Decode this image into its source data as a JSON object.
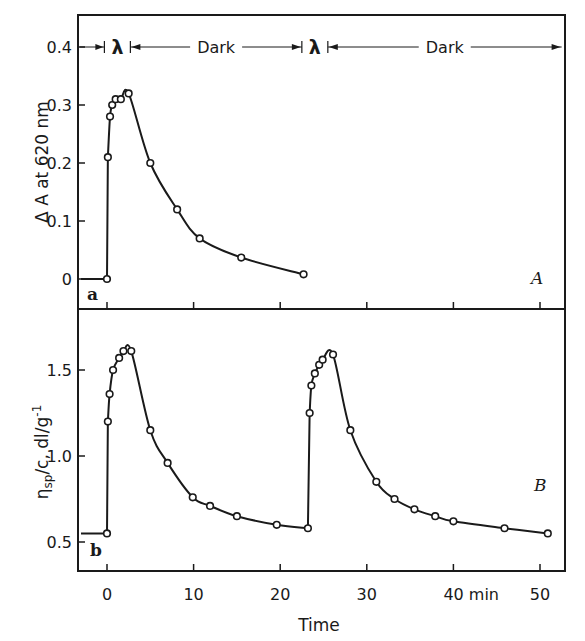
{
  "figure": {
    "x_axis": {
      "label": "Time",
      "unit_label": "min",
      "ticks": [
        0,
        10,
        20,
        30,
        40,
        50
      ],
      "tick_labels": [
        "0",
        "10",
        "20",
        "30",
        "40 min",
        "50"
      ]
    },
    "panel_a": {
      "corner_label": "a",
      "panel_label": "A",
      "ylabel": "Δ A at 620 nm",
      "y_ticks": [
        "0",
        "0.1",
        "0.2",
        "0.3",
        "0.4"
      ],
      "periods": [
        {
          "label": "λ",
          "start": -0.3,
          "end": 2.7
        },
        {
          "label": "Dark",
          "start": 2.7,
          "end": 22.5
        },
        {
          "label": "λ",
          "start": 22.5,
          "end": 25.5
        },
        {
          "label": "Dark",
          "start": 25.5,
          "end": 52.5
        }
      ]
    },
    "panel_b": {
      "corner_label": "b",
      "panel_label": "B",
      "ylabel_main": "η",
      "ylabel_sub": "sp",
      "ylabel_rest": "/c, dl/g",
      "ylabel_sup": "-1",
      "y_ticks": [
        "0.5",
        "1.0",
        "1.5"
      ]
    },
    "colors": {
      "ink": "#1a1a1a",
      "background": "#ffffff"
    }
  },
  "chart_data": [
    {
      "type": "line",
      "title": "",
      "panel": "A",
      "xlabel": "Time (min)",
      "ylabel": "Δ A at 620 nm",
      "xlim": [
        -3,
        53
      ],
      "ylim": [
        -0.05,
        0.44
      ],
      "y_ticks": [
        0,
        0.1,
        0.2,
        0.3,
        0.4
      ],
      "x_ticks": [
        0,
        10,
        20,
        30,
        40,
        50
      ],
      "grid": false,
      "markers": "open circles",
      "annotations": [
        "λ (0–2.5 min)",
        "Dark",
        "λ",
        "Dark",
        "a",
        "A"
      ],
      "series": [
        {
          "name": "ΔA620",
          "x": [
            -3.0,
            0.0,
            0.1,
            0.35,
            0.6,
            1.0,
            1.6,
            2.5,
            5.0,
            8.1,
            10.7,
            15.5,
            22.7
          ],
          "y": [
            0.0,
            0.0,
            0.21,
            0.28,
            0.3,
            0.31,
            0.31,
            0.32,
            0.2,
            0.12,
            0.07,
            0.037,
            0.008
          ],
          "marker_points": [
            [
              0.0,
              0.0
            ],
            [
              0.1,
              0.21
            ],
            [
              0.35,
              0.28
            ],
            [
              0.6,
              0.3
            ],
            [
              1.0,
              0.31
            ],
            [
              1.6,
              0.31
            ],
            [
              2.5,
              0.32
            ],
            [
              5.0,
              0.2
            ],
            [
              8.1,
              0.12
            ],
            [
              10.7,
              0.07
            ],
            [
              15.5,
              0.037
            ],
            [
              22.7,
              0.008
            ]
          ]
        }
      ]
    },
    {
      "type": "line",
      "title": "",
      "panel": "B",
      "xlabel": "Time (min)",
      "ylabel": "ηsp/c, dl/g-1",
      "xlim": [
        -3,
        53
      ],
      "ylim": [
        0.33,
        1.85
      ],
      "y_ticks": [
        0.5,
        1.0,
        1.5
      ],
      "x_ticks": [
        0,
        10,
        20,
        30,
        40,
        50
      ],
      "grid": false,
      "markers": "open circles",
      "annotations": [
        "b",
        "B"
      ],
      "series": [
        {
          "name": "ηsp/c",
          "x": [
            -3.0,
            0.0,
            0.1,
            0.3,
            0.7,
            1.4,
            1.9,
            2.8,
            5.0,
            7.0,
            9.9,
            11.9,
            15.0,
            19.6,
            23.2,
            23.4,
            23.6,
            24.0,
            24.5,
            24.9,
            26.1,
            28.1,
            31.1,
            33.2,
            35.5,
            37.9,
            40.0,
            45.9,
            50.9
          ],
          "y": [
            0.55,
            0.55,
            1.2,
            1.36,
            1.5,
            1.57,
            1.61,
            1.61,
            1.15,
            0.96,
            0.76,
            0.71,
            0.65,
            0.6,
            0.58,
            1.25,
            1.41,
            1.48,
            1.53,
            1.56,
            1.59,
            1.15,
            0.85,
            0.75,
            0.69,
            0.65,
            0.62,
            0.58,
            0.55
          ]
        }
      ]
    }
  ]
}
